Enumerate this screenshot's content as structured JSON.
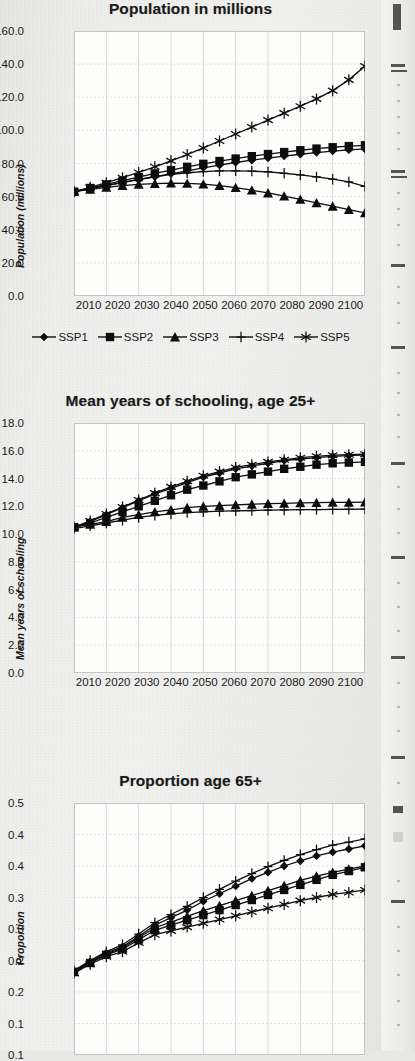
{
  "page": {
    "background_color": "#ecece9",
    "plot_background_color": "#fdfdfc",
    "ink_color": "#101010"
  },
  "legend": {
    "entries": [
      {
        "label": "SSP1",
        "marker": "diamond-marker-icon"
      },
      {
        "label": "SSP2",
        "marker": "square-marker-icon"
      },
      {
        "label": "SSP3",
        "marker": "triangle-marker-icon"
      },
      {
        "label": "SSP4",
        "marker": "plus-marker-icon"
      },
      {
        "label": "SSP5",
        "marker": "asterisk-marker-icon"
      }
    ]
  },
  "chart_data": [
    {
      "type": "line",
      "title": "Population in millions",
      "xlabel": "",
      "ylabel": "Population (millions)",
      "x": [
        2010,
        2015,
        2020,
        2025,
        2030,
        2035,
        2040,
        2045,
        2050,
        2055,
        2060,
        2065,
        2070,
        2075,
        2080,
        2085,
        2090,
        2095,
        2100
      ],
      "xticks": [
        "2010",
        "2020",
        "2030",
        "2040",
        "2050",
        "2060",
        "2070",
        "2080",
        "2090",
        "2100"
      ],
      "yticks": [
        "0.0",
        "20.0",
        "40.0",
        "60.0",
        "80.0",
        "100.0",
        "120.0",
        "140.0",
        "160.0"
      ],
      "ylim": [
        0,
        160
      ],
      "xlim": [
        2010,
        2100
      ],
      "grid": true,
      "legend_position": "below",
      "series": [
        {
          "name": "SSP1",
          "marker": "diamond",
          "values": [
            63.0,
            64.8,
            66.6,
            68.4,
            70.2,
            72.0,
            73.8,
            75.6,
            77.4,
            79.0,
            80.6,
            82.0,
            83.3,
            84.5,
            85.6,
            86.6,
            87.5,
            88.2,
            88.8
          ]
        },
        {
          "name": "SSP2",
          "marker": "square",
          "values": [
            63.0,
            65.2,
            67.4,
            69.6,
            71.8,
            74.0,
            76.0,
            78.0,
            79.8,
            81.5,
            83.0,
            84.4,
            85.7,
            86.9,
            88.0,
            89.0,
            89.8,
            90.5,
            91.0
          ]
        },
        {
          "name": "SSP3",
          "marker": "triangle",
          "values": [
            63.0,
            64.4,
            65.6,
            66.6,
            67.4,
            67.9,
            68.1,
            68.0,
            67.5,
            66.6,
            65.4,
            63.9,
            62.2,
            60.3,
            58.3,
            56.2,
            54.2,
            52.2,
            50.2
          ]
        },
        {
          "name": "SSP4",
          "marker": "plus",
          "values": [
            63.0,
            64.9,
            66.8,
            68.6,
            70.4,
            72.0,
            73.4,
            74.4,
            75.1,
            75.5,
            75.6,
            75.4,
            74.9,
            74.1,
            73.1,
            71.9,
            70.5,
            68.9,
            66.2
          ]
        },
        {
          "name": "SSP5",
          "marker": "asterisk",
          "values": [
            63.0,
            65.6,
            68.4,
            71.4,
            74.6,
            78.0,
            81.6,
            85.4,
            89.4,
            93.6,
            97.8,
            102.0,
            106.2,
            110.4,
            114.6,
            119.0,
            124.0,
            130.5,
            138.8
          ]
        }
      ]
    },
    {
      "type": "line",
      "title": "Mean years of schooling, age 25+",
      "xlabel": "",
      "ylabel": "Mean years of schooling",
      "x": [
        2010,
        2015,
        2020,
        2025,
        2030,
        2035,
        2040,
        2045,
        2050,
        2055,
        2060,
        2065,
        2070,
        2075,
        2080,
        2085,
        2090,
        2095,
        2100
      ],
      "xticks": [
        "2010",
        "2020",
        "2030",
        "2040",
        "2050",
        "2060",
        "2070",
        "2080",
        "2090",
        "2100"
      ],
      "yticks": [
        "0.0",
        "2.0",
        "4.0",
        "6.0",
        "8.0",
        "10.0",
        "12.0",
        "14.0",
        "16.0",
        "18.0"
      ],
      "ylim": [
        0,
        18
      ],
      "xlim": [
        2010,
        2100
      ],
      "grid": true,
      "legend_position": "none",
      "series": [
        {
          "name": "SSP1",
          "marker": "diamond",
          "values": [
            10.5,
            10.9,
            11.4,
            11.9,
            12.4,
            12.9,
            13.3,
            13.7,
            14.1,
            14.4,
            14.7,
            14.9,
            15.1,
            15.3,
            15.4,
            15.5,
            15.6,
            15.65,
            15.7
          ]
        },
        {
          "name": "SSP2",
          "marker": "square",
          "values": [
            10.5,
            10.8,
            11.2,
            11.6,
            12.0,
            12.4,
            12.8,
            13.2,
            13.5,
            13.8,
            14.1,
            14.3,
            14.5,
            14.7,
            14.85,
            15.0,
            15.1,
            15.15,
            15.2
          ]
        },
        {
          "name": "SSP3",
          "marker": "triangle",
          "values": [
            10.5,
            10.7,
            10.9,
            11.2,
            11.4,
            11.6,
            11.75,
            11.9,
            12.0,
            12.05,
            12.1,
            12.15,
            12.2,
            12.22,
            12.25,
            12.27,
            12.28,
            12.29,
            12.3
          ]
        },
        {
          "name": "SSP4",
          "marker": "plus",
          "values": [
            10.4,
            10.6,
            10.8,
            11.0,
            11.2,
            11.35,
            11.45,
            11.55,
            11.6,
            11.65,
            11.68,
            11.7,
            11.72,
            11.74,
            11.76,
            11.77,
            11.78,
            11.79,
            11.8
          ]
        },
        {
          "name": "SSP5",
          "marker": "asterisk",
          "values": [
            10.5,
            10.95,
            11.45,
            11.95,
            12.45,
            12.95,
            13.4,
            13.8,
            14.2,
            14.5,
            14.8,
            15.0,
            15.2,
            15.35,
            15.5,
            15.6,
            15.68,
            15.72,
            15.75
          ]
        }
      ]
    },
    {
      "type": "line",
      "title": "Proportion age 65+",
      "xlabel": "",
      "ylabel": "Proportion",
      "x": [
        2010,
        2015,
        2020,
        2025,
        2030,
        2035,
        2040,
        2045,
        2050,
        2055,
        2060,
        2065,
        2070,
        2075,
        2080,
        2085,
        2090,
        2095,
        2100
      ],
      "xticks": [
        "2010",
        "2020",
        "2030",
        "2040",
        "2050",
        "2060",
        "2070",
        "2080",
        "2090",
        "2100"
      ],
      "yticks": [
        "0.1",
        "0.1",
        "0.2",
        "0.2",
        "0.3",
        "0.3",
        "0.4",
        "0.4",
        "0.5"
      ],
      "ylim": [
        0.1,
        0.5
      ],
      "xlim": [
        2010,
        2100
      ],
      "grid": true,
      "legend_position": "none",
      "clipped_at_bottom": true,
      "series": [
        {
          "name": "SSP1",
          "marker": "diamond",
          "values": [
            0.232,
            0.248,
            0.262,
            0.272,
            0.288,
            0.306,
            0.318,
            0.33,
            0.344,
            0.356,
            0.368,
            0.38,
            0.39,
            0.4,
            0.408,
            0.416,
            0.422,
            0.427,
            0.432
          ]
        },
        {
          "name": "SSP2",
          "marker": "square",
          "values": [
            0.232,
            0.246,
            0.259,
            0.268,
            0.283,
            0.298,
            0.306,
            0.314,
            0.322,
            0.33,
            0.338,
            0.346,
            0.354,
            0.362,
            0.37,
            0.378,
            0.386,
            0.392,
            0.398
          ]
        },
        {
          "name": "SSP3",
          "marker": "triangle",
          "values": [
            0.232,
            0.247,
            0.26,
            0.27,
            0.286,
            0.302,
            0.311,
            0.32,
            0.329,
            0.337,
            0.345,
            0.353,
            0.361,
            0.369,
            0.377,
            0.384,
            0.39,
            0.395,
            0.4
          ]
        },
        {
          "name": "SSP4",
          "marker": "plus",
          "values": [
            0.234,
            0.25,
            0.264,
            0.275,
            0.292,
            0.31,
            0.323,
            0.336,
            0.35,
            0.363,
            0.376,
            0.388,
            0.399,
            0.409,
            0.418,
            0.426,
            0.433,
            0.438,
            0.443
          ]
        },
        {
          "name": "SSP5",
          "marker": "asterisk",
          "values": [
            0.23,
            0.244,
            0.256,
            0.264,
            0.278,
            0.291,
            0.297,
            0.303,
            0.309,
            0.315,
            0.321,
            0.327,
            0.333,
            0.339,
            0.345,
            0.35,
            0.355,
            0.358,
            0.362
          ]
        }
      ]
    }
  ]
}
